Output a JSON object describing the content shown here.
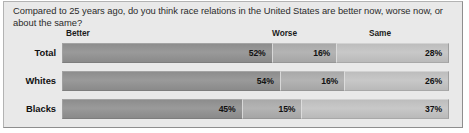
{
  "chart_data": {
    "type": "bar",
    "subtype": "stacked-horizontal-100",
    "title": "Compared to 25 years ago, do you think race relations in the United States are better now, worse now, or about the same?",
    "xlabel": "",
    "ylabel": "",
    "grid": false,
    "legend_position": "top-as-column-headers",
    "categories": [
      "Total",
      "Whites",
      "Blacks"
    ],
    "column_headers": [
      "Better",
      "Worse",
      "Same"
    ],
    "series": [
      {
        "name": "Better",
        "values": [
          52,
          54,
          45
        ],
        "labels": [
          "52%",
          "54%",
          "45%"
        ],
        "color": "#8f8f8f"
      },
      {
        "name": "Worse",
        "values": [
          16,
          16,
          15
        ],
        "labels": [
          "16%",
          "16%",
          "15%"
        ],
        "color": "#b0b0b0"
      },
      {
        "name": "Same",
        "values": [
          28,
          26,
          37
        ],
        "labels": [
          "28%",
          "26%",
          "37%"
        ],
        "color": "#c4c4c4"
      }
    ],
    "rows": [
      {
        "label": "Total",
        "segments": [
          {
            "name": "Better",
            "value": 52,
            "label": "52%"
          },
          {
            "name": "Worse",
            "value": 16,
            "label": "16%"
          },
          {
            "name": "Same",
            "value": 28,
            "label": "28%"
          }
        ]
      },
      {
        "label": "Whites",
        "segments": [
          {
            "name": "Better",
            "value": 54,
            "label": "54%"
          },
          {
            "name": "Worse",
            "value": 16,
            "label": "16%"
          },
          {
            "name": "Same",
            "value": 26,
            "label": "26%"
          }
        ]
      },
      {
        "label": "Blacks",
        "segments": [
          {
            "name": "Better",
            "value": 45,
            "label": "45%"
          },
          {
            "name": "Worse",
            "value": 15,
            "label": "15%"
          },
          {
            "name": "Same",
            "value": 37,
            "label": "37%"
          }
        ]
      }
    ]
  }
}
